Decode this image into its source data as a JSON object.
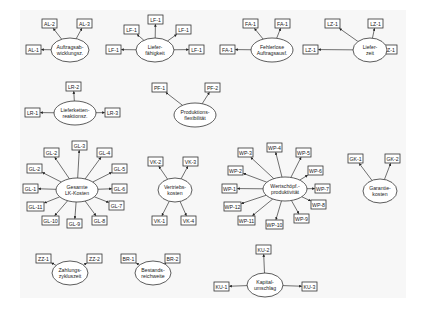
{
  "diagram": {
    "colors": {
      "background": "#ffffff",
      "canvas": "#f7f7f7",
      "stroke": "#333333",
      "text": "#222222"
    },
    "constructs": [
      {
        "id": "al",
        "lines": [
          "Auftragsab-",
          "wicklungsz."
        ],
        "cx": 70,
        "cy": 50,
        "rx": 19,
        "ry": 12,
        "indicators": [
          {
            "label": "AL-2",
            "x": 42,
            "y": 19
          },
          {
            "label": "AL-3",
            "x": 77,
            "y": 19
          },
          {
            "label": "AL-1",
            "x": 26,
            "y": 45
          }
        ]
      },
      {
        "id": "lf",
        "lines": [
          "Liefer-",
          "fähigkeit"
        ],
        "cx": 155,
        "cy": 50,
        "rx": 19,
        "ry": 12,
        "indicators": [
          {
            "label": "LF-1",
            "x": 124,
            "y": 25
          },
          {
            "label": "LF-1",
            "x": 148,
            "y": 15
          },
          {
            "label": "LF-1",
            "x": 176,
            "y": 25
          },
          {
            "label": "LF-1",
            "x": 106,
            "y": 45
          },
          {
            "label": "LF-1",
            "x": 189,
            "y": 45
          }
        ]
      },
      {
        "id": "fa",
        "lines": [
          "Fehlerlose",
          "Auftragsausf."
        ],
        "cx": 272,
        "cy": 50,
        "rx": 21,
        "ry": 12,
        "indicators": [
          {
            "label": "FA-1",
            "x": 243,
            "y": 19
          },
          {
            "label": "FA-1",
            "x": 275,
            "y": 19
          },
          {
            "label": "FA-1",
            "x": 220,
            "y": 45
          }
        ]
      },
      {
        "id": "lz",
        "lines": [
          "Liefer-",
          "zeit"
        ],
        "cx": 370,
        "cy": 50,
        "rx": 17,
        "ry": 12,
        "indicators": [
          {
            "label": "LZ-1",
            "x": 325,
            "y": 19
          },
          {
            "label": "LZ-1",
            "x": 368,
            "y": 19
          },
          {
            "label": "LZ-1",
            "x": 303,
            "y": 45
          },
          {
            "label": "LZ-1",
            "x": 382,
            "y": 45
          }
        ]
      },
      {
        "id": "lr",
        "lines": [
          "Lieferketten-",
          "reaktionsz."
        ],
        "cx": 75,
        "cy": 113,
        "rx": 21,
        "ry": 12,
        "indicators": [
          {
            "label": "LR-2",
            "x": 66,
            "y": 82
          },
          {
            "label": "LR-1",
            "x": 25,
            "y": 108
          },
          {
            "label": "LR-3",
            "x": 105,
            "y": 108
          }
        ]
      },
      {
        "id": "pf",
        "lines": [
          "Produktions-",
          "flexibilität"
        ],
        "cx": 195,
        "cy": 115,
        "rx": 21,
        "ry": 12,
        "indicators": [
          {
            "label": "PF-1",
            "x": 152,
            "y": 83
          },
          {
            "label": "PF-2",
            "x": 205,
            "y": 83
          }
        ]
      },
      {
        "id": "gl",
        "lines": [
          "Gesamte",
          "LK-Kosten"
        ],
        "cx": 77,
        "cy": 190,
        "rx": 21,
        "ry": 12,
        "indicators": [
          {
            "label": "GL-2",
            "x": 44,
            "y": 148
          },
          {
            "label": "GL-3",
            "x": 72,
            "y": 141
          },
          {
            "label": "GL-4",
            "x": 97,
            "y": 148
          },
          {
            "label": "GL-2",
            "x": 27,
            "y": 164
          },
          {
            "label": "GL-5",
            "x": 112,
            "y": 164
          },
          {
            "label": "GL-1",
            "x": 23,
            "y": 184
          },
          {
            "label": "GL-6",
            "x": 112,
            "y": 184
          },
          {
            "label": "GL-11",
            "x": 27,
            "y": 202
          },
          {
            "label": "GL-7",
            "x": 109,
            "y": 201
          },
          {
            "label": "GL-10",
            "x": 42,
            "y": 216
          },
          {
            "label": "GL-9",
            "x": 67,
            "y": 219
          },
          {
            "label": "GL-8",
            "x": 92,
            "y": 216
          }
        ]
      },
      {
        "id": "vk",
        "lines": [
          "Vertriebs-",
          "kosten"
        ],
        "cx": 175,
        "cy": 190,
        "rx": 17,
        "ry": 12,
        "indicators": [
          {
            "label": "VK-2",
            "x": 148,
            "y": 157
          },
          {
            "label": "VK-3",
            "x": 183,
            "y": 157
          },
          {
            "label": "VK-1",
            "x": 152,
            "y": 216
          },
          {
            "label": "VK-4",
            "x": 181,
            "y": 216
          }
        ]
      },
      {
        "id": "wp",
        "lines": [
          "Wertschöpf.-",
          "produktivität"
        ],
        "cx": 285,
        "cy": 189,
        "rx": 22,
        "ry": 12,
        "indicators": [
          {
            "label": "WP-3",
            "x": 238,
            "y": 148
          },
          {
            "label": "WP-4",
            "x": 267,
            "y": 143
          },
          {
            "label": "WP-5",
            "x": 296,
            "y": 148
          },
          {
            "label": "WP-2",
            "x": 228,
            "y": 166
          },
          {
            "label": "WP-6",
            "x": 308,
            "y": 166
          },
          {
            "label": "WP-1",
            "x": 222,
            "y": 184
          },
          {
            "label": "WP-7",
            "x": 315,
            "y": 184
          },
          {
            "label": "WP-12",
            "x": 224,
            "y": 202
          },
          {
            "label": "WP-8",
            "x": 311,
            "y": 200
          },
          {
            "label": "WP-11",
            "x": 238,
            "y": 216
          },
          {
            "label": "WP-10",
            "x": 266,
            "y": 220
          },
          {
            "label": "WP-9",
            "x": 294,
            "y": 214
          }
        ]
      },
      {
        "id": "gk",
        "lines": [
          "Garantie-",
          "kosten"
        ],
        "cx": 380,
        "cy": 191,
        "rx": 17,
        "ry": 12,
        "indicators": [
          {
            "label": "GK-1",
            "x": 348,
            "y": 154
          },
          {
            "label": "GK-2",
            "x": 385,
            "y": 154
          }
        ]
      },
      {
        "id": "zz",
        "lines": [
          "Zahlungs-",
          "zykluszeit"
        ],
        "cx": 70,
        "cy": 273,
        "rx": 18,
        "ry": 12,
        "indicators": [
          {
            "label": "ZZ-1",
            "x": 36,
            "y": 254
          },
          {
            "label": "ZZ-2",
            "x": 87,
            "y": 254
          }
        ]
      },
      {
        "id": "br",
        "lines": [
          "Bestands-",
          "reichweite"
        ],
        "cx": 153,
        "cy": 273,
        "rx": 18,
        "ry": 12,
        "indicators": [
          {
            "label": "BR-1",
            "x": 121,
            "y": 254
          },
          {
            "label": "BR-2",
            "x": 165,
            "y": 254
          }
        ]
      },
      {
        "id": "ku",
        "lines": [
          "Kapital-",
          "umschlag"
        ],
        "cx": 265,
        "cy": 285,
        "rx": 18,
        "ry": 12,
        "indicators": [
          {
            "label": "KU-2",
            "x": 256,
            "y": 245
          },
          {
            "label": "KU-1",
            "x": 214,
            "y": 282
          },
          {
            "label": "KU-3",
            "x": 302,
            "y": 282
          }
        ]
      }
    ]
  }
}
